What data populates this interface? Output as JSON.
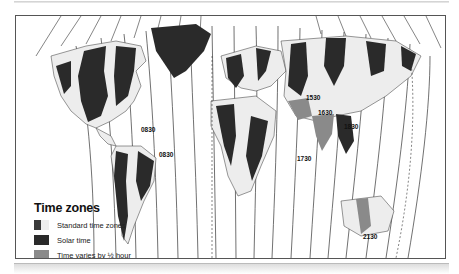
{
  "map": {
    "title": "Time zones",
    "top_labels": [
      "2400",
      "0100",
      "0200",
      "0300",
      "0400",
      "0500",
      "0600",
      "0700",
      "0800",
      "0900",
      "1000",
      "1100",
      "1200 Noon",
      "1300",
      "1400",
      "1500",
      "1600",
      "1700",
      "1800",
      "1900",
      "2000",
      "2100",
      "2200",
      "2300",
      "2400",
      "0100",
      "0200"
    ],
    "left_edge_label": "International date line",
    "right_edge_label": "International date line",
    "offset_labels": {
      "na_newfoundland": "0830",
      "sa_guiana": "0830",
      "iran": "1530",
      "afghanistan": "1630",
      "myanmar": "1830",
      "india": "1730",
      "australia_central": "2130"
    }
  },
  "legend": {
    "title": "Time zones",
    "items": [
      {
        "label": "Standard time zones",
        "swatch": "standard"
      },
      {
        "label": "Solar time",
        "swatch": "solar"
      },
      {
        "label": "Time varies by ½ hour",
        "swatch": "half-hour"
      }
    ]
  },
  "colors": {
    "zone_dark": "#2a2a2a",
    "zone_light": "#ededed",
    "half_hour": "#8a8a8a",
    "ocean": "#ffffff",
    "lines": "#333333"
  }
}
